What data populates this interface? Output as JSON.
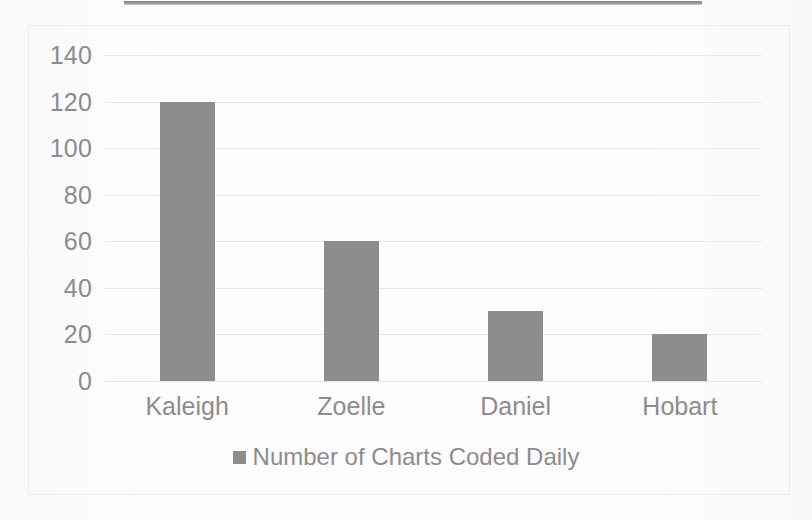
{
  "chart_data": {
    "type": "bar",
    "title": "",
    "subtitle": "",
    "xlabel": "",
    "ylabel": "",
    "categories": [
      "Kaleigh",
      "Zoelle",
      "Daniel",
      "Hobart"
    ],
    "values": [
      120,
      60,
      30,
      20
    ],
    "series": [
      {
        "name": "Number of Charts Coded Daily",
        "values": [
          120,
          60,
          30,
          20
        ],
        "color": "#8d8d8d"
      }
    ],
    "ylim": [
      0,
      140
    ],
    "ytick_step": 20,
    "yticks": [
      140,
      120,
      100,
      80,
      60,
      40,
      20,
      0
    ],
    "ytick_labels": [
      "140",
      "120",
      "100",
      "80",
      "60",
      "40",
      "20",
      "0"
    ],
    "grid": true,
    "grid_axis": "y",
    "grid_color": "#e9e9ea",
    "legend": {
      "position": "bottom",
      "entries": [
        {
          "label": "Number of Charts Coded Daily",
          "color": "#8d8d8d",
          "marker": "square"
        }
      ]
    },
    "axis_label_color": "#8c8c8e",
    "plot_background": "#ffffff"
  },
  "legend": {
    "swatch_name": "legend-color-swatch",
    "label": "Number of Charts Coded Daily"
  },
  "page": {
    "background_color": "#fdfdfd",
    "frame_color": "#ececed",
    "top_rule_color": "#8e8e8e"
  }
}
